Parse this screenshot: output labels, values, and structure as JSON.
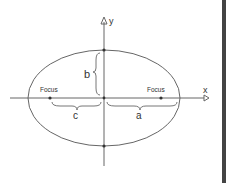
{
  "diagram": {
    "type": "ellipse",
    "labels": {
      "focus_left": "Focus",
      "focus_right": "Focus",
      "x_axis": "x",
      "y_axis": "y",
      "semi_major": "a",
      "semi_minor": "b",
      "focal_distance": "c"
    },
    "colors": {
      "stroke": "#555555",
      "background": "#ffffff",
      "border": "#444444"
    }
  }
}
